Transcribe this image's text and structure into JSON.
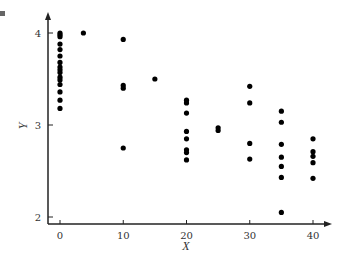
{
  "chart_data": {
    "type": "scatter",
    "title": "",
    "xlabel": "X",
    "ylabel": "Y",
    "xlim": [
      -2,
      42
    ],
    "ylim": [
      1.9,
      4.15
    ],
    "x_ticks": [
      0,
      10,
      20,
      30,
      40
    ],
    "y_ticks": [
      2,
      3,
      4
    ],
    "grid": false,
    "legend": null,
    "points": [
      {
        "x": 0,
        "y": 4.0
      },
      {
        "x": 0,
        "y": 3.98
      },
      {
        "x": 0,
        "y": 3.96
      },
      {
        "x": 0,
        "y": 3.88
      },
      {
        "x": 0,
        "y": 3.82
      },
      {
        "x": 0,
        "y": 3.75
      },
      {
        "x": 0,
        "y": 3.68
      },
      {
        "x": 0,
        "y": 3.63
      },
      {
        "x": 0,
        "y": 3.6
      },
      {
        "x": 0,
        "y": 3.57
      },
      {
        "x": 0,
        "y": 3.52
      },
      {
        "x": 0,
        "y": 3.49
      },
      {
        "x": 0,
        "y": 3.44
      },
      {
        "x": 0,
        "y": 3.36
      },
      {
        "x": 0,
        "y": 3.27
      },
      {
        "x": 0,
        "y": 3.18
      },
      {
        "x": 3.7,
        "y": 4.0
      },
      {
        "x": 10,
        "y": 3.93
      },
      {
        "x": 10,
        "y": 3.43
      },
      {
        "x": 10,
        "y": 3.4
      },
      {
        "x": 10,
        "y": 2.75
      },
      {
        "x": 15,
        "y": 3.5
      },
      {
        "x": 20,
        "y": 3.27
      },
      {
        "x": 20,
        "y": 3.24
      },
      {
        "x": 20,
        "y": 3.13
      },
      {
        "x": 20,
        "y": 2.93
      },
      {
        "x": 20,
        "y": 2.85
      },
      {
        "x": 20,
        "y": 2.73
      },
      {
        "x": 20,
        "y": 2.7
      },
      {
        "x": 20,
        "y": 2.62
      },
      {
        "x": 25,
        "y": 2.97
      },
      {
        "x": 25,
        "y": 2.94
      },
      {
        "x": 30,
        "y": 3.42
      },
      {
        "x": 30,
        "y": 3.24
      },
      {
        "x": 30,
        "y": 2.8
      },
      {
        "x": 30,
        "y": 2.63
      },
      {
        "x": 35,
        "y": 3.15
      },
      {
        "x": 35,
        "y": 3.03
      },
      {
        "x": 35,
        "y": 2.79
      },
      {
        "x": 35,
        "y": 2.65
      },
      {
        "x": 35,
        "y": 2.55
      },
      {
        "x": 35,
        "y": 2.43
      },
      {
        "x": 35,
        "y": 2.05
      },
      {
        "x": 40,
        "y": 2.85
      },
      {
        "x": 40,
        "y": 2.71
      },
      {
        "x": 40,
        "y": 2.66
      },
      {
        "x": 40,
        "y": 2.59
      },
      {
        "x": 40,
        "y": 2.42
      }
    ]
  },
  "colors": {
    "axis": "#222222",
    "point": "#000000",
    "text": "#333333"
  }
}
